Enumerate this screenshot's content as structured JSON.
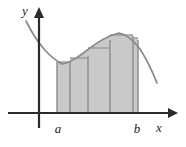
{
  "figure": {
    "kind": "riemann-sum-diagram",
    "title": "",
    "background_color": "#ffffff"
  },
  "axes": {
    "x_axis_label": "x",
    "y_axis_label": "y",
    "axis_color": "#2b2b2b",
    "origin_px": {
      "x": 39,
      "y": 113
    },
    "x_axis_start_px": 8,
    "x_axis_end_px": 174,
    "y_axis_top_px": 10,
    "y_axis_bottom_px": 128
  },
  "ticks": [
    {
      "name": "a",
      "label": "a",
      "x_px": 57
    },
    {
      "name": "b",
      "label": "b",
      "x_px": 138
    }
  ],
  "curve": {
    "color": "#8a8a8a",
    "stroke_width": 1.7,
    "description": "decreasing then increasing to a local maximum then decreasing",
    "points_px": [
      {
        "x": 26,
        "y": 21
      },
      {
        "x": 33,
        "y": 33
      },
      {
        "x": 41,
        "y": 44
      },
      {
        "x": 49,
        "y": 54
      },
      {
        "x": 57,
        "y": 61
      },
      {
        "x": 62,
        "y": 64
      },
      {
        "x": 68,
        "y": 63
      },
      {
        "x": 76,
        "y": 59
      },
      {
        "x": 85,
        "y": 52
      },
      {
        "x": 94,
        "y": 45
      },
      {
        "x": 103,
        "y": 39
      },
      {
        "x": 111,
        "y": 35
      },
      {
        "x": 119,
        "y": 33
      },
      {
        "x": 127,
        "y": 35
      },
      {
        "x": 135,
        "y": 41
      },
      {
        "x": 143,
        "y": 52
      },
      {
        "x": 151,
        "y": 67
      },
      {
        "x": 157,
        "y": 82
      }
    ]
  },
  "rectangles": {
    "fill_color": "#c9c9c9",
    "edge_color": "#8f8f8f",
    "baseline_y_px": 113,
    "bars": [
      {
        "name": "bar-1",
        "x_left_px": 57,
        "x_right_px": 70,
        "top_y_px": 62
      },
      {
        "name": "bar-2",
        "x_left_px": 70,
        "x_right_px": 88,
        "top_y_px": 58
      },
      {
        "name": "bar-3",
        "x_left_px": 88,
        "x_right_px": 110,
        "top_y_px": 48
      },
      {
        "name": "bar-4",
        "x_left_px": 110,
        "x_right_px": 133,
        "top_y_px": 35
      },
      {
        "name": "bar-5",
        "x_left_px": 133,
        "x_right_px": 138,
        "top_y_px": 38
      }
    ]
  }
}
